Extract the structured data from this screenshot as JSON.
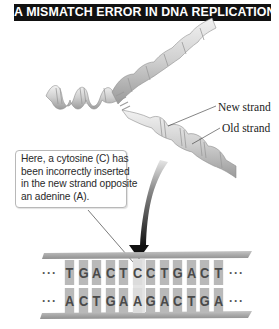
{
  "title": "A MISMATCH ERROR IN DNA REPLICATION",
  "labels": {
    "new_strand": "New strand",
    "old_strand": "Old strand"
  },
  "callout": {
    "lines": [
      "Here, a cytosine (C) has",
      "been incorrectly inserted",
      "in the new strand opposite",
      "an adenine (A)."
    ]
  },
  "sequence": {
    "ellipsis": "···",
    "new_strand_bases": [
      "T",
      "G",
      "A",
      "C",
      "T",
      "C",
      "C",
      "T",
      "G",
      "A",
      "C",
      "T"
    ],
    "old_strand_bases": [
      "A",
      "C",
      "T",
      "G",
      "A",
      "A",
      "G",
      "A",
      "C",
      "T",
      "G",
      "A"
    ],
    "mismatch_index": 5
  },
  "colors": {
    "title_bg": "#111111",
    "title_text": "#ffffff",
    "base_box": "#b9b9b9",
    "mismatch_highlight": "#dcdcdc",
    "rail": "#a8a8a8",
    "arrow": "#1a1a1a"
  }
}
